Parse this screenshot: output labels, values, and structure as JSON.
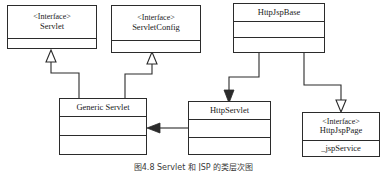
{
  "diagram": {
    "kind": "uml-class-diagram",
    "caption": "图4.8 Servlet 和 JSP 的类层次图",
    "colors": {
      "background": "#ffffff",
      "stroke": "#2b2b2b",
      "text": "#1a1a1a",
      "fill": "#ffffff"
    },
    "classes": [
      {
        "id": "servlet",
        "stereotype": "<Interface>",
        "name": "Servlet",
        "members": [],
        "compartments": 2,
        "x": 7,
        "y": 5,
        "width": 90,
        "height": 44
      },
      {
        "id": "servlet-config",
        "stereotype": "<Interface>",
        "name": "ServletConfig",
        "members": [],
        "compartments": 2,
        "x": 111,
        "y": 5,
        "width": 90,
        "height": 48
      },
      {
        "id": "http-jsp-base",
        "stereotype": "",
        "name": "HttpJspBase",
        "members": [],
        "compartments": 3,
        "x": 233,
        "y": 3,
        "width": 92,
        "height": 50
      },
      {
        "id": "generic-servlet",
        "stereotype": "",
        "name": "Generic Servlet",
        "members": [],
        "compartments": 3,
        "x": 59,
        "y": 98,
        "width": 88,
        "height": 57
      },
      {
        "id": "http-servlet",
        "stereotype": "",
        "name": "HttpServlet",
        "members": [],
        "compartments": 3,
        "x": 188,
        "y": 101,
        "width": 83,
        "height": 54
      },
      {
        "id": "http-jsp-page",
        "stereotype": "<Interface>",
        "name": "HttpJspPage",
        "members": [
          "_jspService"
        ],
        "compartments": 2,
        "x": 302,
        "y": 112,
        "width": 78,
        "height": 45
      }
    ],
    "relationships": [
      {
        "id": "generic-servlet-implements-servlet",
        "from": "generic-servlet",
        "to": "servlet",
        "type": "realization",
        "arrowhead": "hollow-triangle"
      },
      {
        "id": "generic-servlet-implements-servlet-config",
        "from": "generic-servlet",
        "to": "servlet-config",
        "type": "realization",
        "arrowhead": "hollow-triangle"
      },
      {
        "id": "http-servlet-extends-generic-servlet",
        "from": "http-servlet",
        "to": "generic-servlet",
        "type": "generalization",
        "arrowhead": "solid-arrow"
      },
      {
        "id": "http-jsp-base-extends-http-servlet",
        "from": "http-jsp-base",
        "to": "http-servlet",
        "type": "generalization",
        "arrowhead": "solid-arrow"
      },
      {
        "id": "http-jsp-base-implements-http-jsp-page",
        "from": "http-jsp-base",
        "to": "http-jsp-page",
        "type": "realization",
        "arrowhead": "hollow-triangle"
      }
    ]
  }
}
